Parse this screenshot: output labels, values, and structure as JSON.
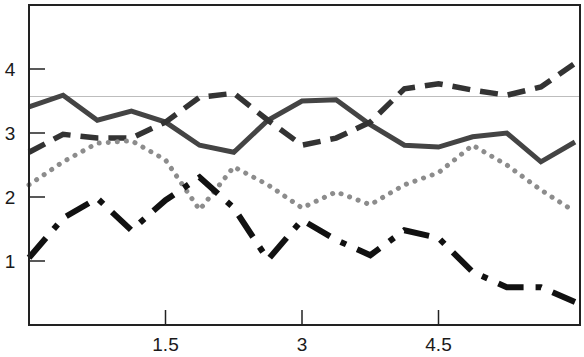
{
  "chart_data": {
    "type": "line",
    "title": "",
    "xlabel": "",
    "ylabel": "",
    "xlim": [
      0,
      6.0
    ],
    "ylim": [
      0,
      4.85
    ],
    "grid": false,
    "legend": null,
    "x_ticks": [
      1.5,
      3,
      4.5
    ],
    "x_tick_labels": [
      "1.5",
      "3",
      "4.5"
    ],
    "y_ticks": [
      1,
      2,
      3,
      4
    ],
    "y_tick_labels": [
      "1",
      "2",
      "3",
      "4"
    ],
    "reference_line": {
      "y": 3.57,
      "color": "#bdbdbd"
    },
    "x": [
      0,
      0.375,
      0.75,
      1.125,
      1.5,
      1.875,
      2.25,
      2.625,
      3.0,
      3.375,
      3.75,
      4.125,
      4.5,
      4.875,
      5.25,
      5.625,
      6.0
    ],
    "series": [
      {
        "name": "solid",
        "style": "solid",
        "color": "#444444",
        "values": [
          3.41,
          3.59,
          3.2,
          3.34,
          3.17,
          2.81,
          2.7,
          3.2,
          3.5,
          3.52,
          3.13,
          2.81,
          2.78,
          2.94,
          3.0,
          2.55,
          2.86
        ]
      },
      {
        "name": "dashed",
        "style": "dashed",
        "color": "#333333",
        "values": [
          2.7,
          2.98,
          2.92,
          2.92,
          3.17,
          3.56,
          3.62,
          3.2,
          2.81,
          2.92,
          3.17,
          3.69,
          3.77,
          3.67,
          3.59,
          3.72,
          4.09
        ]
      },
      {
        "name": "dotted",
        "style": "dotted",
        "color": "#8c8c8c",
        "values": [
          2.19,
          2.55,
          2.84,
          2.88,
          2.58,
          1.8,
          2.47,
          2.19,
          1.83,
          2.08,
          1.88,
          2.19,
          2.38,
          2.81,
          2.5,
          2.11,
          1.77
        ]
      },
      {
        "name": "dash-dot",
        "style": "dashdot",
        "color": "#111111",
        "values": [
          1.05,
          1.67,
          1.98,
          1.48,
          1.95,
          2.31,
          1.83,
          1.02,
          1.64,
          1.33,
          1.09,
          1.48,
          1.36,
          0.83,
          0.59,
          0.59,
          0.36
        ]
      }
    ]
  }
}
